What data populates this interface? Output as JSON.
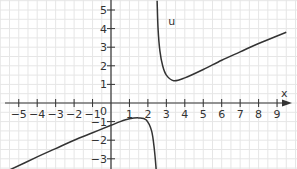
{
  "chart_data": {
    "type": "line",
    "title": "",
    "xlabel": "x",
    "ylabel": "",
    "xlim": [
      -5.9,
      9.8
    ],
    "ylim": [
      -3.6,
      5.5
    ],
    "grid": true,
    "x_ticks": [
      -5,
      -4,
      -3,
      -2,
      -1,
      1,
      2,
      3,
      4,
      5,
      6,
      7,
      8,
      9
    ],
    "y_ticks": [
      -3,
      -2,
      -1,
      1,
      2,
      3,
      4,
      5
    ],
    "origin_label": "0",
    "series": [
      {
        "name": "u",
        "label_position": [
          3.1,
          4.2
        ],
        "vertical_asymptote": 2.5,
        "branches": [
          {
            "x": [
              -5.5,
              -4,
              -3,
              -2,
              -1,
              0,
              0.5,
              1,
              1.5,
              1.9,
              2.2,
              2.35,
              2.45
            ],
            "y": [
              -3.6,
              -2.9,
              -2.45,
              -2.0,
              -1.6,
              -1.2,
              -1.0,
              -0.85,
              -0.8,
              -0.9,
              -1.5,
              -2.5,
              -3.6
            ]
          },
          {
            "x": [
              2.5,
              2.55,
              2.65,
              2.8,
              3.0,
              3.4,
              4,
              5,
              6,
              7,
              8,
              9,
              9.5
            ],
            "y": [
              5.5,
              4.0,
              2.8,
              2.0,
              1.5,
              1.2,
              1.35,
              1.8,
              2.3,
              2.75,
              3.2,
              3.6,
              3.8
            ]
          }
        ]
      }
    ]
  },
  "labels": {
    "x_axis": "x",
    "origin": "0",
    "curve": "u"
  }
}
